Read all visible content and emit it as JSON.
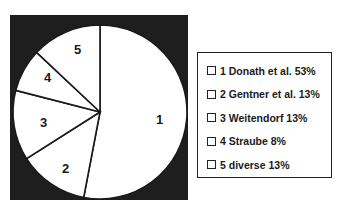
{
  "chart_data": {
    "type": "pie",
    "title": "",
    "categories": [
      "1 Donath et al.",
      "2 Gentner et al.",
      "3 Weitendorf",
      "4 Straube",
      "5 diverse"
    ],
    "values": [
      53,
      13,
      13,
      8,
      13
    ],
    "unit": "%",
    "slice_labels": [
      "1",
      "2",
      "3",
      "4",
      "5"
    ],
    "legend_position": "right",
    "start_angle_deg": 0,
    "direction": "clockwise",
    "colors": {
      "slice_fill": "#ffffff",
      "slice_stroke": "#1a1a1a",
      "background": "#1e1e1e"
    }
  },
  "legend": {
    "items": [
      {
        "label": "1 Donath et al. 53%"
      },
      {
        "label": "2 Gentner et al. 13%"
      },
      {
        "label": "3 Weitendorf 13%"
      },
      {
        "label": "4 Straube 8%"
      },
      {
        "label": "5 diverse 13%"
      }
    ]
  },
  "pie": {
    "labels": [
      "1",
      "2",
      "3",
      "4",
      "5"
    ]
  }
}
